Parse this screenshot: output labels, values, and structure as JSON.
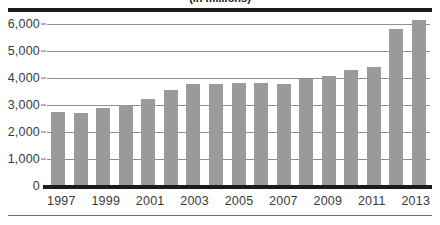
{
  "figure": {
    "title": "(in millions)",
    "title_cropped": true
  },
  "colors": {
    "bar": "#9a9a9a",
    "axis_rule": "#1b1b1b",
    "gridline": "#8d8d8d",
    "text": "#3a3a3a"
  },
  "chart_data": {
    "type": "bar",
    "title": "(in millions)",
    "xlabel": "",
    "ylabel": "",
    "ylim": [
      0,
      6000
    ],
    "yticks": [
      0,
      1000,
      2000,
      3000,
      4000,
      5000,
      6000
    ],
    "ytick_labels": [
      "0",
      "1,000",
      "2,000",
      "3,000",
      "4,000",
      "5,000",
      "6,000"
    ],
    "grid": true,
    "legend": "none",
    "categories": [
      "1997",
      "1998",
      "1999",
      "2000",
      "2001",
      "2002",
      "2003",
      "2004",
      "2005",
      "2006",
      "2007",
      "2008",
      "2009",
      "2010",
      "2011",
      "2012",
      "2013"
    ],
    "xtick_labels_shown": [
      "1997",
      "",
      "1999",
      "",
      "2001",
      "",
      "2003",
      "",
      "2005",
      "",
      "2007",
      "",
      "2009",
      "",
      "2011",
      "",
      "2013"
    ],
    "values": [
      2750,
      2700,
      2880,
      3000,
      3240,
      3540,
      3790,
      3790,
      3800,
      3820,
      3790,
      3950,
      4080,
      4280,
      4420,
      5800,
      6150
    ]
  }
}
